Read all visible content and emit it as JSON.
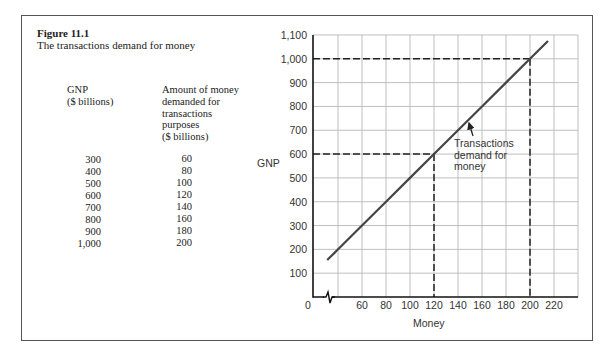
{
  "figure": {
    "label": "Figure 11.1",
    "caption": "The transactions demand for money"
  },
  "table": {
    "gnp_header": [
      "GNP",
      "($ billions)"
    ],
    "money_header": [
      "Amount of money",
      "demanded for",
      "transactions",
      "purposes",
      "($ billions)"
    ],
    "gnp_values": [
      "300",
      "400",
      "500",
      "600",
      "700",
      "800",
      "900",
      "1,000"
    ],
    "money_values": [
      "60",
      "80",
      "100",
      "120",
      "140",
      "160",
      "180",
      "200"
    ]
  },
  "chart_data": {
    "type": "line",
    "title": "",
    "xlabel": "Money",
    "ylabel": "GNP",
    "xlim": [
      0,
      240
    ],
    "ylim": [
      0,
      1100
    ],
    "x_axis_break": true,
    "grid": true,
    "x_ticks": [
      0,
      60,
      80,
      100,
      120,
      140,
      160,
      180,
      200,
      220
    ],
    "x_tick_labels": [
      "0",
      "60",
      "80",
      "100",
      "120",
      "140",
      "160",
      "180",
      "200",
      "220"
    ],
    "x_grid": [
      40,
      60,
      80,
      100,
      120,
      140,
      160,
      180,
      200,
      220,
      240
    ],
    "y_ticks": [
      100,
      200,
      300,
      400,
      500,
      600,
      700,
      800,
      900,
      1000,
      1100
    ],
    "y_tick_labels": [
      "100",
      "200",
      "300",
      "400",
      "500",
      "600",
      "700",
      "800",
      "900",
      "1,000",
      "1,100"
    ],
    "series": [
      {
        "name": "Transactions demand for money",
        "x": [
          31,
          60,
          80,
          100,
          120,
          140,
          160,
          180,
          200,
          215
        ],
        "y": [
          155,
          300,
          400,
          500,
          600,
          700,
          800,
          900,
          1000,
          1075
        ],
        "color": "#444444"
      }
    ],
    "reference_points": [
      {
        "x": 120,
        "y": 600
      },
      {
        "x": 200,
        "y": 1000
      }
    ],
    "annotation": {
      "lines": [
        "Transactions",
        "demand for",
        "money"
      ],
      "arrow_to": {
        "x": 148,
        "y": 735
      }
    }
  }
}
